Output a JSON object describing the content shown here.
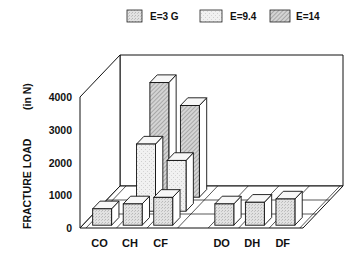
{
  "chart_data": {
    "type": "bar",
    "style": "3d-oblique-grouped",
    "title": "",
    "xlabel": "",
    "ylabel": "FRACTURE LOAD   (in N)",
    "ylim": [
      0,
      4000
    ],
    "yticks": [
      0,
      1000,
      2000,
      3000,
      4000
    ],
    "grid": false,
    "legend_position": "top",
    "categories": [
      "CO",
      "CH",
      "CF",
      "DO",
      "DH",
      "DF"
    ],
    "series": [
      {
        "name": "E=3 G",
        "fill": "light-stipple",
        "values": [
          500,
          650,
          850,
          650,
          700,
          800
        ]
      },
      {
        "name": "E=9.4",
        "fill": "white-stipple",
        "values": [
          0,
          2050,
          1550,
          0,
          0,
          0
        ]
      },
      {
        "name": "E=14",
        "fill": "hatched",
        "values": [
          0,
          3500,
          2800,
          0,
          0,
          0
        ]
      }
    ]
  },
  "legend": [
    {
      "label": "E=3  G",
      "swatch": "light-stipple"
    },
    {
      "label": "E=9.4",
      "swatch": "white-stipple"
    },
    {
      "label": "E=14",
      "swatch": "hatched"
    }
  ],
  "axis": {
    "ylabel": "FRACTURE LOAD",
    "ylabel_unit": "(in N)",
    "tick_labels": [
      "0",
      "1000",
      "2000",
      "3000",
      "4000"
    ],
    "category_labels": [
      "CO",
      "CH",
      "CF",
      "DO",
      "DH",
      "DF"
    ]
  },
  "colors": {
    "ink": "#111111",
    "light_stipple": "#d9d9d9",
    "white_stipple": "#eeeeee",
    "hatch_bg": "#cfcfcf",
    "top_face": "#f7f7f7",
    "side_face": "#ffffff"
  }
}
